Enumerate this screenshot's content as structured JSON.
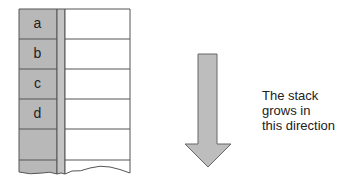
{
  "stack": {
    "cells": [
      {
        "label": "a"
      },
      {
        "label": "b"
      },
      {
        "label": "c"
      },
      {
        "label": "d"
      },
      {
        "label": ""
      },
      {
        "label": ""
      }
    ],
    "fill_color": "#b8b8b8",
    "line_color": "#555555"
  },
  "arrow": {
    "direction": "down",
    "fill_color": "#bdbdbd"
  },
  "caption": {
    "line1": "The stack",
    "line2": "grows in",
    "line3": "this direction"
  }
}
